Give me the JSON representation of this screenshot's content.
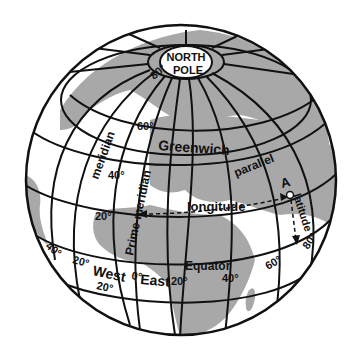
{
  "figure": {
    "type": "globe-latitude-longitude-diagram",
    "colors": {
      "land": "#a8a8a8",
      "ocean": "#ffffff",
      "lines": "#111111"
    }
  },
  "labels": {
    "north_pole_line1": "NORTH",
    "north_pole_line2": "POLE",
    "greenwich": "Greenwich",
    "meridian": "meridian",
    "prime_meridian": "Prime meridian",
    "parallel": "parallel",
    "longitude": "longitude",
    "latitude": "latitude",
    "equator": "Equator",
    "point_a": "A",
    "west": "West",
    "east": "East"
  },
  "latitude_ticks": {
    "lat80": "80°",
    "lat60": "60°",
    "lat40": "40°",
    "lat20": "20°",
    "lat_minus20": "20°"
  },
  "longitude_ticks": {
    "w40": "40°",
    "w20": "20°",
    "zero": "0°",
    "e20": "20°",
    "e40": "40°",
    "e60": "60°",
    "e80": "80°"
  }
}
